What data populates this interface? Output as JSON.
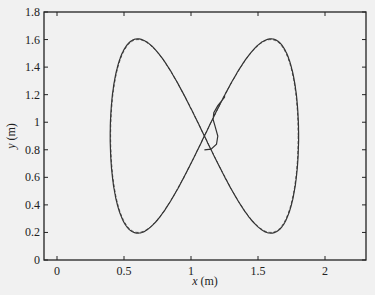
{
  "chart_data": {
    "type": "line",
    "title": "",
    "xlabel": "x (m)",
    "ylabel": "y (m)",
    "xlim": [
      -0.1,
      2.3
    ],
    "ylim": [
      0,
      1.8
    ],
    "xticks": [
      0,
      0.5,
      1,
      1.5,
      2
    ],
    "xtick_labels": [
      "0",
      "0.5",
      "1",
      "1.5",
      "2"
    ],
    "yticks": [
      0,
      0.2,
      0.4,
      0.6,
      0.8,
      1,
      1.2,
      1.4,
      1.6,
      1.8
    ],
    "ytick_labels": [
      "0",
      "0.2",
      "0.4",
      "0.6",
      "0.8",
      "1",
      "1.2",
      "1.4",
      "1.6",
      "1.8"
    ],
    "grid": false,
    "legend": null,
    "series": [
      {
        "name": "desired trajectory",
        "style": "dashed",
        "description": "figure-eight reference path centered at (1.1, 0.9)",
        "param": "x = 1.1 + 0.7*cos(t), y = 0.9 - 0.7*sin(2t)",
        "points": [
          [
            1.8,
            0.9
          ],
          [
            1.6,
            1.6
          ],
          [
            1.1,
            0.9
          ],
          [
            0.6,
            0.2
          ],
          [
            0.4,
            0.9
          ],
          [
            0.6,
            1.6
          ],
          [
            1.1,
            0.9
          ],
          [
            1.6,
            0.2
          ],
          [
            1.8,
            0.9
          ]
        ]
      },
      {
        "name": "actual trajectory",
        "style": "solid",
        "description": "starts near (1.1, 0.8), converges onto the reference figure-eight",
        "start": [
          1.1,
          0.8
        ],
        "points": [
          [
            1.1,
            0.8
          ],
          [
            1.18,
            0.83
          ],
          [
            1.2,
            0.92
          ],
          [
            1.17,
            1.0
          ],
          [
            1.16,
            1.05
          ],
          [
            1.2,
            1.12
          ],
          [
            1.3,
            1.25
          ],
          [
            1.45,
            1.45
          ],
          [
            1.6,
            1.6
          ],
          [
            1.75,
            1.4
          ],
          [
            1.8,
            0.9
          ],
          [
            1.75,
            0.4
          ],
          [
            1.6,
            0.2
          ],
          [
            1.45,
            0.35
          ],
          [
            1.1,
            0.9
          ],
          [
            0.75,
            1.45
          ],
          [
            0.6,
            1.6
          ],
          [
            0.45,
            1.4
          ],
          [
            0.4,
            0.9
          ],
          [
            0.45,
            0.4
          ],
          [
            0.6,
            0.2
          ],
          [
            0.75,
            0.35
          ],
          [
            1.1,
            0.9
          ]
        ]
      }
    ]
  }
}
